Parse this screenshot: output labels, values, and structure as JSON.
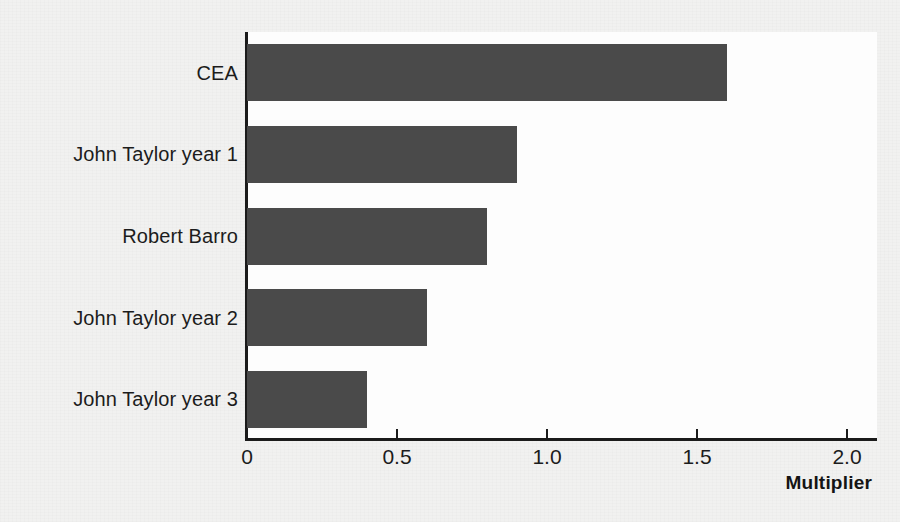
{
  "chart_data": {
    "type": "bar",
    "orientation": "horizontal",
    "title": "",
    "subtitle": "",
    "xlabel": "Multiplier",
    "ylabel": "",
    "categories": [
      "CEA",
      "John Taylor year 1",
      "Robert Barro",
      "John Taylor year 2",
      "John Taylor year 3"
    ],
    "values": [
      1.6,
      0.9,
      0.8,
      0.6,
      0.4
    ],
    "xlim": [
      0,
      2.1
    ],
    "xticks": [
      0,
      0.5,
      1.0,
      1.5,
      2.0
    ],
    "xtick_labels": [
      "0",
      "0.5",
      "1.0",
      "1.5",
      "2.0"
    ],
    "grid": false,
    "legend": false,
    "bar_color": "#4a4a4a",
    "axis_color": "#1b1b1b",
    "plot_background": "#fdfdfd",
    "page_background": "#f1f1f0"
  },
  "axis": {
    "x_title": "Multiplier"
  }
}
